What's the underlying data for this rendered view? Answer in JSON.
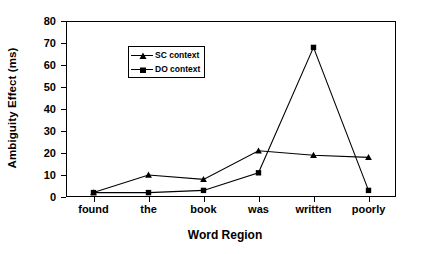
{
  "chart_data": {
    "type": "line",
    "title": "",
    "xlabel": "Word Region",
    "ylabel": "Ambiguity Effect (ms)",
    "categories": [
      "found",
      "the",
      "book",
      "was",
      "written",
      "poorly"
    ],
    "series": [
      {
        "name": "SC context",
        "marker": "triangle",
        "values": [
          2,
          10,
          8,
          21,
          19,
          18
        ]
      },
      {
        "name": "DO context",
        "marker": "square",
        "values": [
          2,
          2,
          3,
          11,
          68,
          3
        ]
      }
    ],
    "ylim": [
      0,
      80
    ],
    "ytick_values": [
      0,
      10,
      20,
      30,
      40,
      50,
      60,
      70,
      80
    ],
    "ytick_labels": [
      "0",
      "10",
      "20",
      "30",
      "40",
      "50",
      "60",
      "70",
      "80"
    ],
    "grid": false,
    "legend_position": "upper-left-inside",
    "line_color": "#000000",
    "background_color": "#ffffff"
  },
  "legend": {
    "entries": [
      {
        "label": "SC context",
        "marker": "triangle-marker"
      },
      {
        "label": "DO context",
        "marker": "square-marker"
      }
    ]
  }
}
